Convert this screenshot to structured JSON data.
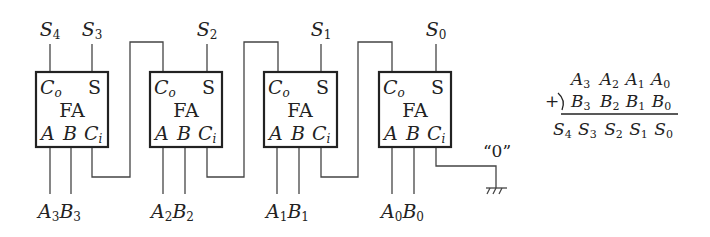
{
  "diagram": {
    "block_label": "FA",
    "pin_labels": {
      "carry_out": "C",
      "carry_out_sub": "o",
      "sum": "S",
      "a": "A",
      "b": "B",
      "carry_in": "C",
      "carry_in_sub": "i"
    },
    "stages": [
      {
        "sum_label": "S",
        "sum_sub": "3",
        "a_label": "A",
        "a_sub": "3",
        "b_label": "B",
        "b_sub": "3"
      },
      {
        "sum_label": "S",
        "sum_sub": "2",
        "a_label": "A",
        "a_sub": "2",
        "b_label": "B",
        "b_sub": "2"
      },
      {
        "sum_label": "S",
        "sum_sub": "1",
        "a_label": "A",
        "a_sub": "1",
        "b_label": "B",
        "b_sub": "1"
      },
      {
        "sum_label": "S",
        "sum_sub": "0",
        "a_label": "A",
        "a_sub": "0",
        "b_label": "B",
        "b_sub": "0"
      }
    ],
    "final_carry": {
      "label": "S",
      "sub": "4"
    },
    "carry_in_constant": "“0”",
    "ground_symbol": "ground-icon"
  },
  "equation": {
    "operator": "+",
    "row1": [
      {
        "v": "A",
        "s": "3"
      },
      {
        "v": "A",
        "s": "2"
      },
      {
        "v": "A",
        "s": "1"
      },
      {
        "v": "A",
        "s": "0"
      }
    ],
    "row2": [
      {
        "v": "B",
        "s": "3"
      },
      {
        "v": "B",
        "s": "2"
      },
      {
        "v": "B",
        "s": "1"
      },
      {
        "v": "B",
        "s": "0"
      }
    ],
    "result": [
      {
        "v": "S",
        "s": "4"
      },
      {
        "v": "S",
        "s": "3"
      },
      {
        "v": "S",
        "s": "2"
      },
      {
        "v": "S",
        "s": "1"
      },
      {
        "v": "S",
        "s": "0"
      }
    ]
  },
  "colors": {
    "line": "#333333",
    "box": "#222222",
    "text": "#222222",
    "background": "#ffffff"
  }
}
